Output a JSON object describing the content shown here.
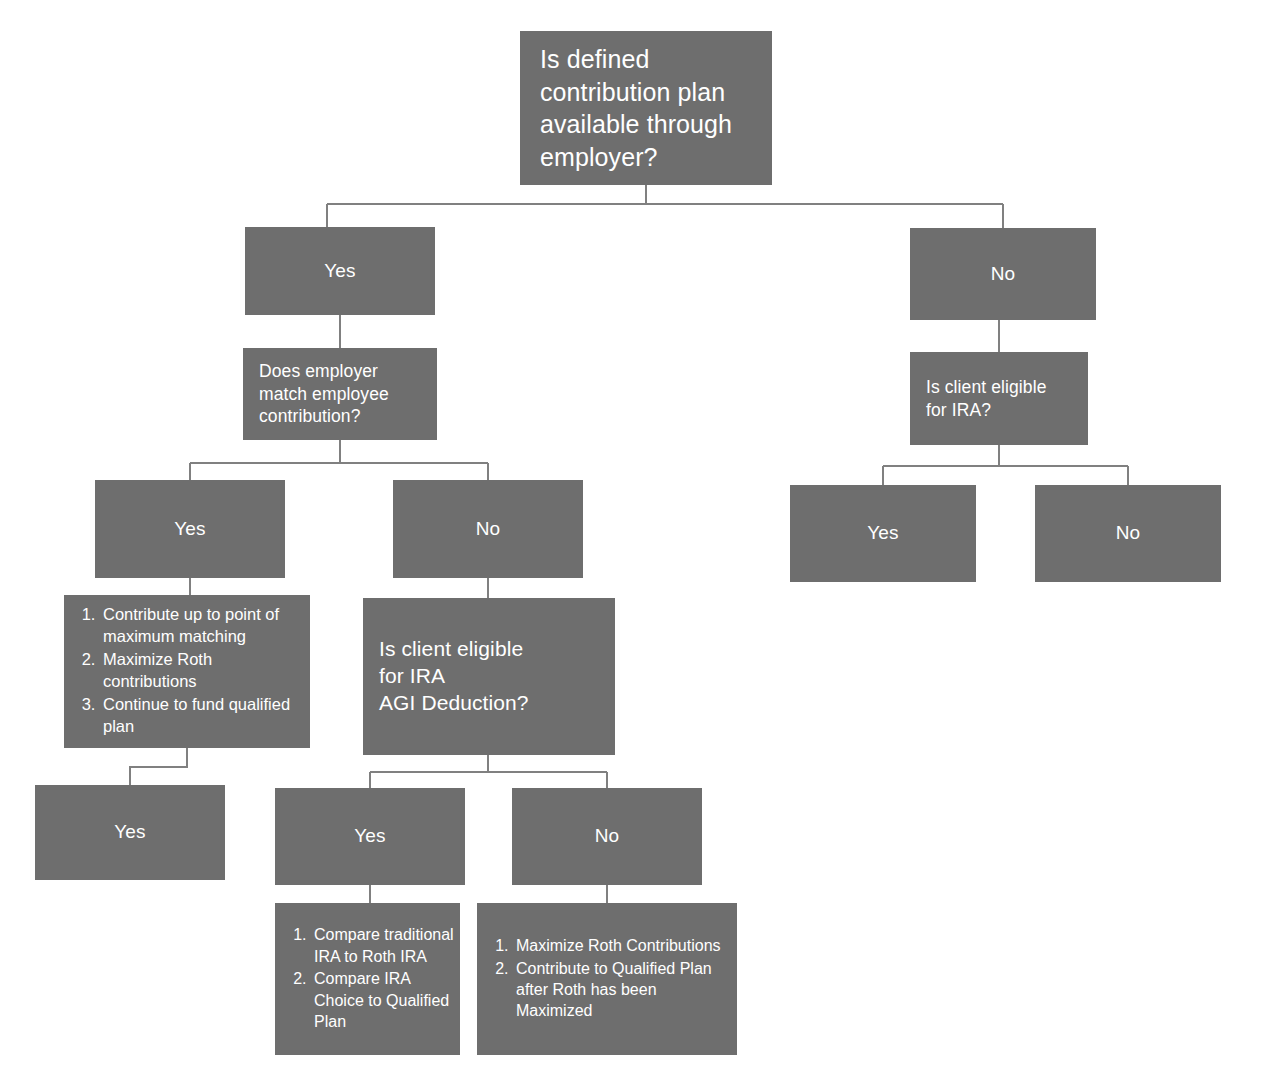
{
  "diagram": {
    "box_color": "#6e6e6e",
    "text_color": "#ffffff",
    "line_color": "#808080",
    "background": "#ffffff"
  },
  "nodes": {
    "root": {
      "text": "Is defined\ncontribution plan\navailable through\nemployer?"
    },
    "l1_yes": {
      "text": "Yes"
    },
    "l1_no": {
      "text": "No"
    },
    "employer_match": {
      "text": "Does employer\nmatch employee\ncontribution?"
    },
    "ira_eligible": {
      "text": "Is client eligible\nfor IRA?"
    },
    "match_yes": {
      "text": "Yes"
    },
    "match_no": {
      "text": "No"
    },
    "ira_yes": {
      "text": "Yes"
    },
    "ira_no": {
      "text": "No"
    },
    "match_yes_actions": {
      "items": [
        "Contribute up to point of maximum matching",
        "Maximize Roth contributions",
        "Continue to fund qualified plan"
      ]
    },
    "agi_deduction": {
      "text": "Is client eligible\nfor IRA\nAGI Deduction?"
    },
    "match_yes_actions_yes": {
      "text": "Yes"
    },
    "agi_yes": {
      "text": "Yes"
    },
    "agi_no": {
      "text": "No"
    },
    "agi_yes_actions": {
      "items": [
        "Compare traditional IRA to Roth IRA",
        "Compare IRA Choice to Qualified Plan"
      ]
    },
    "agi_no_actions": {
      "items": [
        "Maximize Roth Contributions",
        "Contribute to Qualified Plan after Roth has been Maximized"
      ]
    }
  }
}
